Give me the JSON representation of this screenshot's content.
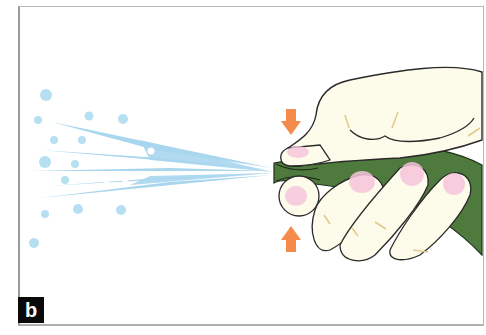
{
  "figure": {
    "panel_label": "b",
    "elements": {
      "hand": {
        "fill": "#fdfbe9",
        "outline": "#2a2a2a",
        "fingernail_color": "#f6c6dc",
        "crease_color": "#e6c98e"
      },
      "hose": {
        "color": "#4f7a3e",
        "outline": "#1f2f18"
      },
      "spray": {
        "color": "#a8d6ee",
        "droplet_color": "#b6e0f2",
        "highlight_color": "#ffffff"
      },
      "arrows": {
        "color": "#f58a4b",
        "top_direction": "down",
        "bottom_direction": "up"
      }
    },
    "colors": {
      "background": "#ffffff",
      "frame_border": "#b0b0b0",
      "label_bg": "#0a0a0a",
      "label_text": "#ffffff"
    }
  }
}
